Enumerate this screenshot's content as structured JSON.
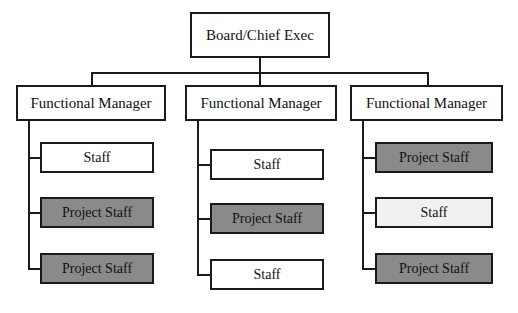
{
  "diagram": {
    "type": "org-chart",
    "root": {
      "label": "Board/Chief Exec",
      "fill": "white",
      "box": {
        "x": 190,
        "y": 12,
        "w": 140,
        "h": 46
      }
    },
    "branches": [
      {
        "manager": {
          "label": "Functional Manager",
          "fill": "white",
          "box": {
            "x": 16,
            "y": 85,
            "w": 150,
            "h": 36
          }
        },
        "children": [
          {
            "label": "Staff",
            "fill": "white",
            "box": {
              "x": 40,
              "y": 142,
              "w": 114,
              "h": 31
            }
          },
          {
            "label": "Project Staff",
            "fill": "shaded",
            "box": {
              "x": 40,
              "y": 197,
              "w": 114,
              "h": 31
            }
          },
          {
            "label": "Project Staff",
            "fill": "shaded",
            "box": {
              "x": 40,
              "y": 253,
              "w": 114,
              "h": 31
            }
          }
        ],
        "stem": {
          "x": 28,
          "topY": 121,
          "bottomY": 269,
          "stubEndX": 40
        }
      },
      {
        "manager": {
          "label": "Functional Manager",
          "fill": "white",
          "box": {
            "x": 185,
            "y": 85,
            "w": 152,
            "h": 36
          }
        },
        "children": [
          {
            "label": "Staff",
            "fill": "white",
            "box": {
              "x": 210,
              "y": 149,
              "w": 114,
              "h": 31
            }
          },
          {
            "label": "Project Staff",
            "fill": "shaded",
            "box": {
              "x": 210,
              "y": 203,
              "w": 114,
              "h": 31
            }
          },
          {
            "label": "Staff",
            "fill": "white",
            "box": {
              "x": 210,
              "y": 259,
              "w": 114,
              "h": 31
            }
          }
        ],
        "stem": {
          "x": 197,
          "topY": 121,
          "bottomY": 275,
          "stubEndX": 210
        }
      },
      {
        "manager": {
          "label": "Functional Manager",
          "fill": "white",
          "box": {
            "x": 350,
            "y": 85,
            "w": 153,
            "h": 36
          }
        },
        "children": [
          {
            "label": "Project Staff",
            "fill": "shaded",
            "box": {
              "x": 375,
              "y": 142,
              "w": 118,
              "h": 31
            }
          },
          {
            "label": "Staff",
            "fill": "light",
            "box": {
              "x": 375,
              "y": 197,
              "w": 118,
              "h": 31
            }
          },
          {
            "label": "Project Staff",
            "fill": "shaded",
            "box": {
              "x": 375,
              "y": 253,
              "w": 118,
              "h": 31
            }
          }
        ],
        "stem": {
          "x": 362,
          "topY": 121,
          "bottomY": 269,
          "stubEndX": 375
        }
      }
    ],
    "bus": {
      "drop_from_root": {
        "x": 259,
        "y1": 58,
        "y2": 72
      },
      "horizontal": {
        "x1": 91,
        "x2": 427,
        "y": 72
      },
      "drops": [
        {
          "x": 91,
          "y1": 72,
          "y2": 85
        },
        {
          "x": 259,
          "y1": 72,
          "y2": 85
        },
        {
          "x": 427,
          "y1": 72,
          "y2": 85
        }
      ]
    },
    "colors": {
      "stroke": "#1a1a1a",
      "shaded_fill": "#8a8a8a",
      "light_fill": "#f1f1f1",
      "white_fill": "#ffffff",
      "text": "#111111",
      "background": "#ffffff"
    }
  }
}
